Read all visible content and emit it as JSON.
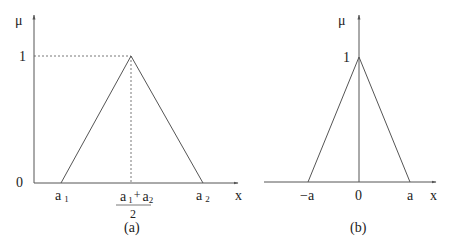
{
  "panel_a": {
    "caption": "(a)",
    "y_label": "μ",
    "x_label": "x",
    "y_tick_one": "1",
    "y_tick_zero": "0",
    "x_tick_a1_base": "a",
    "x_tick_a1_sub": "1",
    "x_tick_a2_base": "a",
    "x_tick_a2_sub": "2",
    "mid_num_a1_base": "a",
    "mid_num_a1_sub": "1",
    "mid_plus": "+",
    "mid_num_a2_base": "a",
    "mid_num_a2_sub": "2",
    "mid_den": "2"
  },
  "panel_b": {
    "caption": "(b)",
    "y_label": "μ",
    "x_label": "x",
    "y_tick_one": "1",
    "x_tick_neg_a": "−a",
    "x_tick_zero": "0",
    "x_tick_a": "a"
  },
  "colors": {
    "line": "#555555",
    "text": "#222222",
    "background": "#ffffff"
  }
}
